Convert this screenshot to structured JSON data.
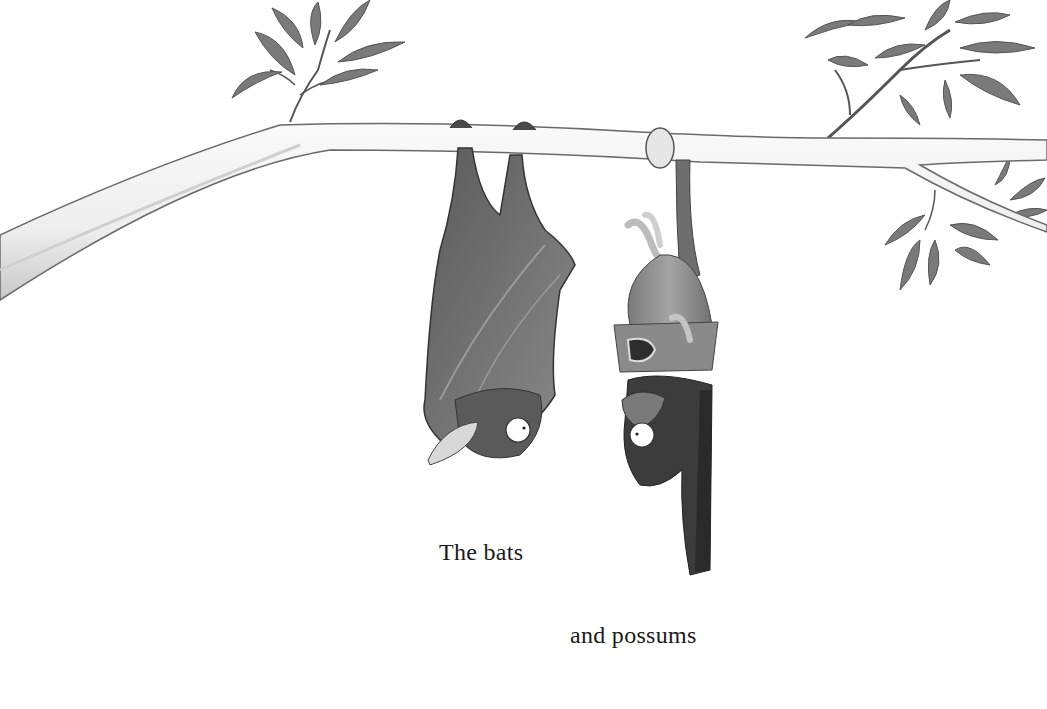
{
  "page": {
    "captions": [
      {
        "text": "The bats"
      },
      {
        "text": "and possums"
      },
      {
        "text": ""
      }
    ]
  },
  "illustration": {
    "subjects": [
      "bat-hanging-upside-down",
      "possum-hanging-by-tail"
    ],
    "elements": [
      "tree-branch",
      "leaves-left",
      "leaves-right"
    ],
    "colors": {
      "background": "#ffffff",
      "branch_fill": "#f2f2f2",
      "branch_outline": "#6a6a6a",
      "leaf": "#7d7d7d",
      "bat_body": "#5e5e5e",
      "bat_wing": "#787878",
      "possum_body": "#8c8c8c",
      "possum_dark": "#3c3c3c",
      "text": "#1a1a1a"
    }
  }
}
